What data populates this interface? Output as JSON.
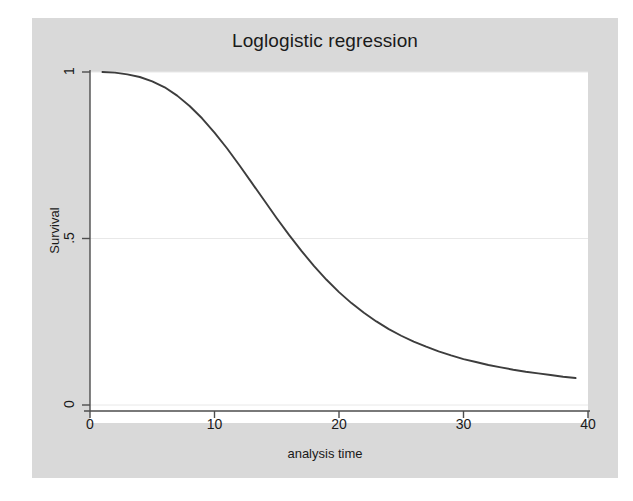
{
  "chart_data": {
    "type": "line",
    "title": "Loglogistic regression",
    "xlabel": "analysis time",
    "ylabel": "Survival",
    "xlim": [
      0,
      40
    ],
    "ylim": [
      0,
      1
    ],
    "xticks": [
      0,
      10,
      20,
      30,
      40
    ],
    "xticklabels": [
      "0",
      "10",
      "20",
      "30",
      "40"
    ],
    "yticks": [
      0,
      0.5,
      1
    ],
    "yticklabels": [
      "0",
      ".5",
      "1"
    ],
    "grid": "horizontal",
    "legend": "none",
    "series": [
      {
        "name": "Survival",
        "color": "#3d3d3d",
        "x": [
          1.0,
          2.0,
          3.0,
          4.0,
          5.0,
          6.0,
          7.0,
          8.0,
          9.0,
          10.0,
          11.0,
          12.0,
          13.0,
          14.0,
          15.0,
          16.0,
          17.0,
          18.0,
          19.0,
          20.0,
          21.0,
          22.0,
          23.0,
          24.0,
          25.0,
          26.0,
          27.0,
          28.0,
          29.0,
          30.0,
          31.0,
          32.0,
          33.0,
          34.0,
          35.0,
          36.0,
          37.0,
          38.0,
          39.0
        ],
        "y": [
          1.0,
          0.998,
          0.993,
          0.985,
          0.972,
          0.954,
          0.929,
          0.898,
          0.861,
          0.818,
          0.771,
          0.72,
          0.667,
          0.614,
          0.561,
          0.51,
          0.462,
          0.417,
          0.376,
          0.339,
          0.306,
          0.277,
          0.251,
          0.228,
          0.208,
          0.19,
          0.175,
          0.161,
          0.149,
          0.138,
          0.129,
          0.12,
          0.113,
          0.106,
          0.1,
          0.095,
          0.09,
          0.085,
          0.081
        ]
      }
    ],
    "annotations": []
  },
  "figure": {
    "background_color": "#ffffff",
    "canvas_color": "#d9d9d9",
    "plot_background_color": "#ffffff",
    "axis_color": "#4d4d4d",
    "gridline_color": "#e8e8e8",
    "text_color": "#1a1a1a"
  }
}
